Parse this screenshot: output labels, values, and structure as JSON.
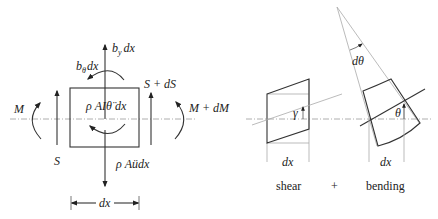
{
  "free_body_diagram": {
    "labels": {
      "body_force_y": "b",
      "body_force_y_sub": "y",
      "body_force_y_suffix": "dx",
      "body_moment": "b",
      "body_moment_sub": "θ",
      "body_moment_suffix": "dx",
      "shear_right": "S + dS",
      "shear_left": "S",
      "moment_left": "M",
      "moment_right": "M + dM",
      "rotary_inertia": "ρ AIθ̈ dx",
      "translational_inertia": "ρ Aüdx",
      "width": "dx"
    }
  },
  "deformation_diagram": {
    "shear": {
      "angle_label": "γ",
      "width_label": "dx",
      "caption": "shear"
    },
    "plus": "+",
    "bending": {
      "angle_label": "θ",
      "rotation_label": "dθ",
      "width_label": "dx",
      "caption": "bending"
    }
  },
  "colors": {
    "stroke": "#333333",
    "axis": "#999999",
    "background": "#ffffff"
  }
}
